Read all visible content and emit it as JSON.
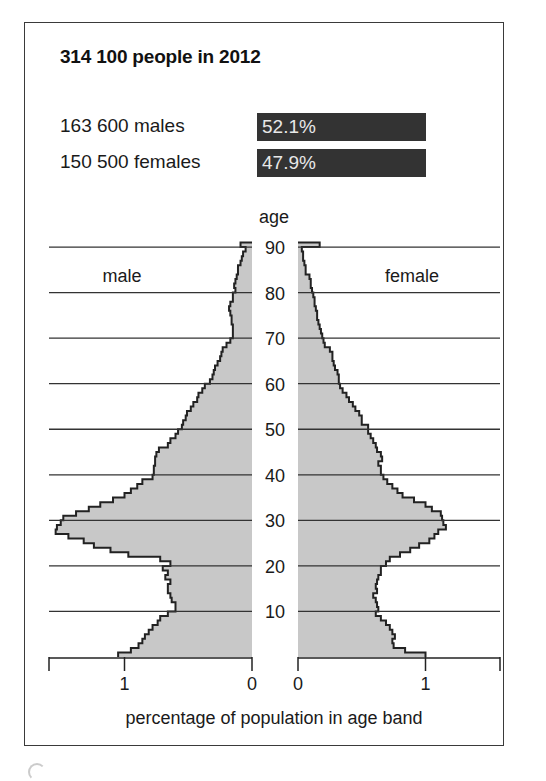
{
  "header": {
    "title": "314 100 people in 2012",
    "stats": [
      {
        "label": "163 600 males",
        "percent": "52.1%"
      },
      {
        "label": "150 500 females",
        "percent": "47.9%"
      }
    ]
  },
  "colors": {
    "bar_fill": "#c8c8c8",
    "outline": "#222222",
    "stat_bar": "#333333",
    "gridline": "#333333"
  },
  "chart_data": {
    "type": "bar",
    "subtype": "population-pyramid",
    "title": "314 100 people in 2012",
    "xlabel": "percentage of population in age band",
    "ylabel": "age",
    "left_label": "male",
    "right_label": "female",
    "y_ticks": [
      10,
      20,
      30,
      40,
      50,
      60,
      70,
      80,
      90
    ],
    "x_ticks_left": [
      1,
      0
    ],
    "x_ticks_right": [
      0,
      1
    ],
    "xlim": [
      0,
      1.6
    ],
    "ylim": [
      0,
      90
    ],
    "grid": true,
    "categories": [
      0,
      1,
      2,
      3,
      4,
      5,
      6,
      7,
      8,
      9,
      10,
      11,
      12,
      13,
      14,
      15,
      16,
      17,
      18,
      19,
      20,
      21,
      22,
      23,
      24,
      25,
      26,
      27,
      28,
      29,
      30,
      31,
      32,
      33,
      34,
      35,
      36,
      37,
      38,
      39,
      40,
      41,
      42,
      43,
      44,
      45,
      46,
      47,
      48,
      49,
      50,
      51,
      52,
      53,
      54,
      55,
      56,
      57,
      58,
      59,
      60,
      61,
      62,
      63,
      64,
      65,
      66,
      67,
      68,
      69,
      70,
      71,
      72,
      73,
      74,
      75,
      76,
      77,
      78,
      79,
      80,
      81,
      82,
      83,
      84,
      85,
      86,
      87,
      88,
      89,
      "90+"
    ],
    "series": [
      {
        "name": "male",
        "values": [
          1.05,
          0.95,
          0.89,
          0.86,
          0.84,
          0.81,
          0.78,
          0.74,
          0.72,
          0.66,
          0.6,
          0.6,
          0.63,
          0.64,
          0.66,
          0.66,
          0.64,
          0.68,
          0.66,
          0.7,
          0.64,
          0.72,
          0.97,
          1.11,
          1.24,
          1.32,
          1.44,
          1.54,
          1.53,
          1.5,
          1.48,
          1.38,
          1.28,
          1.19,
          1.09,
          1.0,
          0.95,
          0.9,
          0.86,
          0.78,
          0.77,
          0.77,
          0.76,
          0.76,
          0.75,
          0.73,
          0.66,
          0.64,
          0.6,
          0.58,
          0.55,
          0.54,
          0.52,
          0.51,
          0.48,
          0.46,
          0.43,
          0.42,
          0.39,
          0.37,
          0.33,
          0.31,
          0.3,
          0.29,
          0.27,
          0.25,
          0.24,
          0.23,
          0.2,
          0.17,
          0.15,
          0.15,
          0.15,
          0.16,
          0.16,
          0.17,
          0.18,
          0.17,
          0.15,
          0.15,
          0.13,
          0.14,
          0.13,
          0.12,
          0.11,
          0.11,
          0.09,
          0.08,
          0.07,
          0.05,
          0.09
        ]
      },
      {
        "name": "female",
        "values": [
          1.0,
          0.84,
          0.75,
          0.74,
          0.76,
          0.74,
          0.72,
          0.69,
          0.65,
          0.61,
          0.63,
          0.62,
          0.61,
          0.59,
          0.62,
          0.61,
          0.62,
          0.63,
          0.65,
          0.65,
          0.69,
          0.72,
          0.8,
          0.88,
          0.95,
          1.03,
          1.07,
          1.1,
          1.16,
          1.14,
          1.13,
          1.12,
          1.05,
          1.0,
          0.91,
          0.82,
          0.78,
          0.74,
          0.7,
          0.67,
          0.65,
          0.65,
          0.63,
          0.66,
          0.65,
          0.62,
          0.61,
          0.59,
          0.57,
          0.55,
          0.55,
          0.5,
          0.5,
          0.48,
          0.45,
          0.43,
          0.4,
          0.38,
          0.35,
          0.33,
          0.32,
          0.32,
          0.31,
          0.29,
          0.28,
          0.27,
          0.27,
          0.25,
          0.21,
          0.2,
          0.19,
          0.18,
          0.17,
          0.16,
          0.15,
          0.15,
          0.14,
          0.13,
          0.13,
          0.12,
          0.11,
          0.1,
          0.1,
          0.09,
          0.06,
          0.06,
          0.05,
          0.04,
          0.04,
          0.03,
          0.17
        ]
      }
    ]
  }
}
